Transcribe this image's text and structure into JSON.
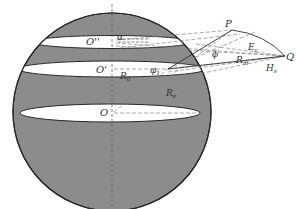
{
  "diagram": {
    "type": "geometry",
    "colors": {
      "sphere_fill": "#8c8c8c",
      "outline": "#2a2a2a",
      "band_fill": "#ffffff",
      "dashed": "#777777",
      "text": "#333333"
    },
    "labels": {
      "O_double_prime": "O''",
      "O_prime": "O'",
      "O": "O",
      "alpha": "α",
      "R0": "R",
      "R0_sub": "0",
      "phi1": "φ",
      "phi1_sub": "1",
      "Re": "R",
      "Re_sub": "e",
      "P": "P",
      "Q": "Q",
      "phi": "ϕ",
      "E": "E",
      "E_sub": "c",
      "Rm": "R",
      "Rm_sub": "m",
      "Hs": "H",
      "Hs_sub": "s"
    }
  }
}
